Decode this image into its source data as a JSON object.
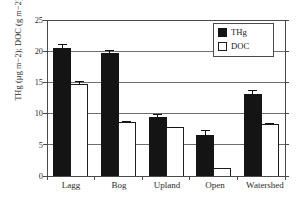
{
  "chart_data": {
    "type": "bar",
    "title": "",
    "xlabel": "",
    "ylabel": "THg (µg m−2); DOC (g m−2)",
    "ylim": [
      0,
      25
    ],
    "yticks": [
      0,
      5,
      10,
      15,
      20,
      25
    ],
    "ytick_labels": [
      "0",
      "5",
      "10",
      "15",
      "20",
      "25"
    ],
    "grid": "horizontal",
    "legend_position": "top-right",
    "categories": [
      "Lagg",
      "Bog",
      "Upland",
      "Open",
      "Watershed"
    ],
    "series": [
      {
        "name": "THg",
        "fill": "#141414",
        "values": [
          20.5,
          19.6,
          9.3,
          6.5,
          13.1
        ],
        "errors": [
          0.65,
          0.5,
          0.6,
          0.75,
          0.55
        ]
      },
      {
        "name": "DOC",
        "fill": "#ffffff",
        "values": [
          14.6,
          8.6,
          7.7,
          1.2,
          8.3
        ],
        "errors": [
          0.55,
          0.12,
          0.1,
          0.0,
          0.12
        ]
      }
    ]
  },
  "legend": {
    "entries": [
      {
        "label": "THg",
        "swatch": "filled-square"
      },
      {
        "label": "DOC",
        "swatch": "open-square"
      }
    ]
  },
  "axis": {
    "y_label": "THg (µg m−2); DOC (g m−2)",
    "y_tick_0": "0",
    "y_tick_1": "5",
    "y_tick_2": "10",
    "y_tick_3": "15",
    "y_tick_4": "20",
    "y_tick_5": "25",
    "x_tick_0": "Lagg",
    "x_tick_1": "Bog",
    "x_tick_2": "Upland",
    "x_tick_3": "Open",
    "x_tick_4": "Watershed"
  },
  "colors": {
    "thg_fill": "#141414",
    "doc_fill": "#ffffff",
    "axis": "#4a4a4a",
    "grid": "#6e6e6e",
    "text": "#2b2b2b"
  }
}
